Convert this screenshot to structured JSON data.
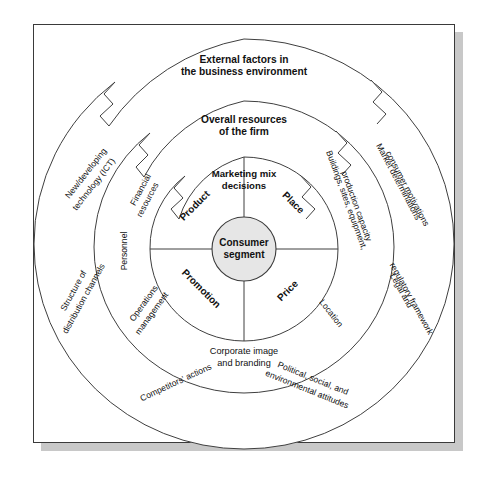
{
  "figure": {
    "title_center": "Consumer segment",
    "rings": [
      {
        "id": "outer",
        "heading_line1": "External factors in",
        "heading_line2": "the business environment",
        "labels": [
          "New/developing technology (ICT)",
          "Structure of distribution channels",
          "Competitors' actions",
          "Political, social, and environmental attitudes",
          "Legal and regulatory framework",
          "Market determinations consumer motivations"
        ]
      },
      {
        "id": "middle",
        "heading_line1": "Overall resources",
        "heading_line2": "of the firm",
        "labels": [
          "Financial resources",
          "Personnel",
          "Operations management",
          "Corporate image and branding",
          "Location",
          "Buildings, sites, equipment, production capacity"
        ]
      },
      {
        "id": "inner",
        "heading_line1": "Marketing mix",
        "heading_line2": "decisions",
        "labels": [
          "Product",
          "Place",
          "Promotion",
          "Price"
        ]
      }
    ],
    "outer_labels": {
      "technology_l1": "New/developing",
      "technology_l2": "technology (ICT)",
      "distribution_l1": "Structure of",
      "distribution_l2": "distribution channels",
      "competitors": "Competitors' actions",
      "political_l1": "Political, social, and",
      "political_l2": "environmental attitudes",
      "legal_l1": "Legal and",
      "legal_l2": "regulatory framework",
      "market_l1": "Market determinations",
      "market_l2": "consumer motivations"
    },
    "middle_labels": {
      "financial_l1": "Financial",
      "financial_l2": "resources",
      "personnel": "Personnel",
      "operations_l1": "Operations",
      "operations_l2": "management",
      "corporate_l1": "Corporate image",
      "corporate_l2": "and branding",
      "location": "Location",
      "buildings_l1": "Buildings, sites, equipment,",
      "buildings_l2": "production capacity"
    },
    "mix": {
      "heading_l1": "Marketing mix",
      "heading_l2": "decisions",
      "product": "Product",
      "place": "Place",
      "promotion": "Promotion",
      "price": "Price"
    },
    "hub": {
      "line1": "Consumer",
      "line2": "segment"
    },
    "colors": {
      "hub_fill": "#e6e6e6",
      "stroke": "#3f3f3f",
      "frame_border": "#3a3a3a",
      "shadow": "#c8c8c8",
      "background": "#ffffff",
      "text": "#111111"
    }
  }
}
